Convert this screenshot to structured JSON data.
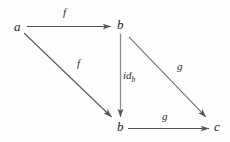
{
  "diagram": {
    "type": "commutative-diagram",
    "background_color": "#fdfdfd",
    "stroke_color": "#555555",
    "text_color": "#1d1d1d",
    "nodes": [
      {
        "id": "a",
        "label": "a",
        "x": 14,
        "y": 20
      },
      {
        "id": "b_top",
        "label": "b",
        "x": 117,
        "y": 18
      },
      {
        "id": "b_bottom",
        "label": "b",
        "x": 117,
        "y": 120
      },
      {
        "id": "c",
        "label": "c",
        "x": 214,
        "y": 120
      }
    ],
    "edges": [
      {
        "id": "a-to-b-top",
        "label": "f",
        "from": "a",
        "to": "b_top",
        "label_x": 63,
        "label_y": 7
      },
      {
        "id": "a-to-b-bottom",
        "label": "f",
        "from": "a",
        "to": "b_bottom",
        "label_x": 77,
        "label_y": 58
      },
      {
        "id": "b-top-to-b-bottom",
        "label": "id_b",
        "from": "b_top",
        "to": "b_bottom",
        "label_x": 123,
        "label_y": 70,
        "label_base": "id",
        "label_sub": "b"
      },
      {
        "id": "b-top-to-c",
        "label": "g",
        "from": "b_top",
        "to": "c",
        "label_x": 177,
        "label_y": 61
      },
      {
        "id": "b-bottom-to-c",
        "label": "g",
        "from": "b_bottom",
        "to": "c",
        "label_x": 162,
        "label_y": 111
      }
    ]
  }
}
